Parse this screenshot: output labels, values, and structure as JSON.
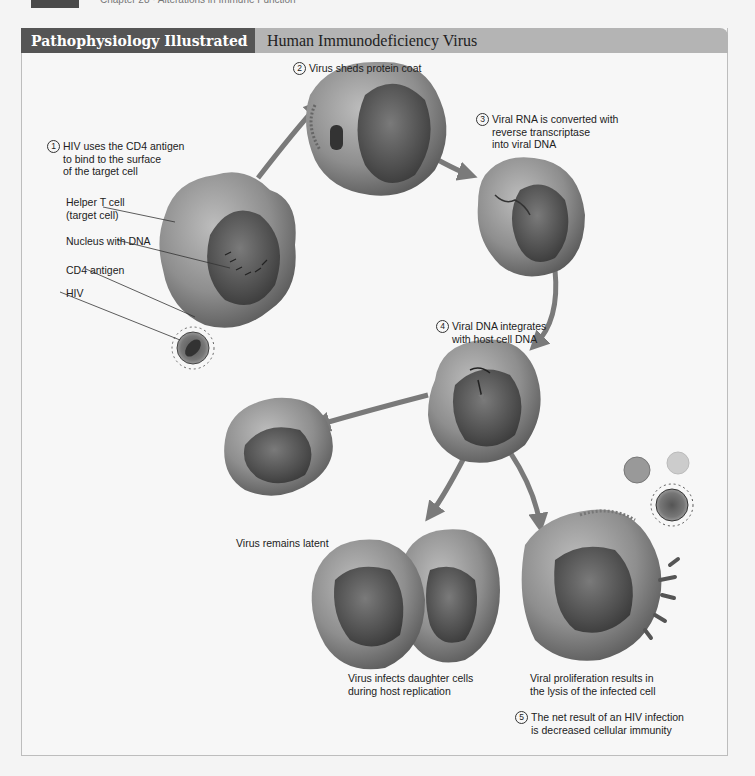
{
  "page_header": {
    "chapter_text": "Chapter 28 · Alterations in Immune Function"
  },
  "figure": {
    "header_left": "Pathophysiology Illustrated",
    "header_right": "Human Immunodeficiency Virus",
    "colors": {
      "header_dark": "#555555",
      "header_light": "#b4b4b4",
      "frame_border": "#bdbdbd",
      "arrow": "#7a7a7a"
    },
    "steps": [
      {
        "number": "1",
        "text": "HIV uses the CD4 antigen\nto bind to the surface\nof the target cell"
      },
      {
        "number": "2",
        "text": "Virus sheds protein coat"
      },
      {
        "number": "3",
        "text": "Viral RNA is converted with\nreverse transcriptase\ninto viral DNA"
      },
      {
        "number": "4",
        "text": "Viral DNA integrates\nwith host cell DNA"
      },
      {
        "number": "5",
        "text": "The net result of an HIV infection\nis decreased cellular immunity"
      }
    ],
    "callouts": [
      {
        "label": "Helper T cell\n(target cell)"
      },
      {
        "label": "Nucleus with DNA"
      },
      {
        "label": "CD4 antigen"
      },
      {
        "label": "HIV"
      }
    ],
    "outcomes": [
      {
        "text": "Virus remains latent"
      },
      {
        "text": "Virus infects daughter cells\nduring host replication"
      },
      {
        "text": "Viral proliferation results in\nthe lysis of the infected cell"
      }
    ],
    "virus_label": "RNA"
  }
}
